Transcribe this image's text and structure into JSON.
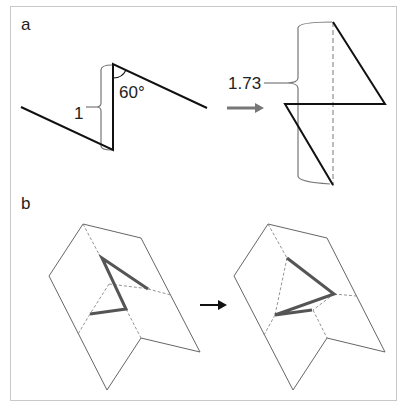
{
  "figure": {
    "panels": [
      {
        "id": "a",
        "label": "a",
        "before": {
          "bracket_label": "1",
          "angle_label": "60°"
        },
        "arrow": "right-arrow",
        "after": {
          "bracket_label": "1.73"
        }
      },
      {
        "id": "b",
        "label": "b",
        "arrow": "right-arrow"
      }
    ]
  },
  "colors": {
    "frame": "#c8c8c8",
    "path_bold": "#111111",
    "bracket": "#777777",
    "arrow_gray": "#777777",
    "arrow_black": "#111111",
    "fold_outline": "#666666",
    "fold_dashed": "#888888",
    "crease_bold": "#555555"
  }
}
